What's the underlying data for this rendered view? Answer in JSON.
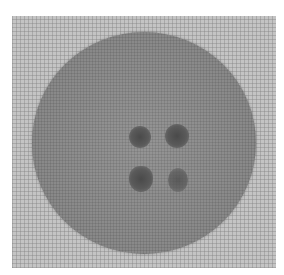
{
  "image": {
    "subject": "round button with four holes",
    "background": "grid-patterned surface",
    "colors": {
      "background": "#c4c4c4",
      "disc": "#8e8e8e",
      "holes": "#4a4a4a"
    },
    "holes": 4
  }
}
